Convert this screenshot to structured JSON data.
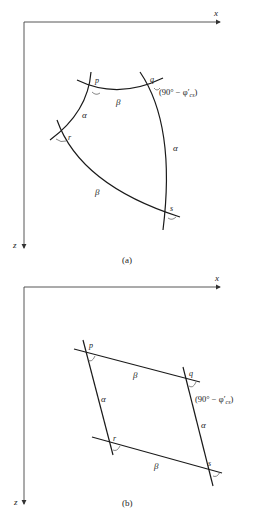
{
  "figure_a": {
    "caption": "(a)",
    "axes": {
      "x_label": "x",
      "z_label": "z"
    },
    "points": {
      "p": "p",
      "q": "q",
      "r": "r",
      "s": "s"
    },
    "edges": {
      "pq": "β",
      "pr": "α",
      "qs": "α",
      "rs": "β"
    },
    "angle_label": "(90° − φ′cs)",
    "angle_main": "(90° − φ′",
    "angle_sub": "cs",
    "angle_close": ")"
  },
  "figure_b": {
    "caption": "(b)",
    "axes": {
      "x_label": "x",
      "z_label": "z"
    },
    "points": {
      "p": "p",
      "q": "q",
      "r": "r",
      "s": "s"
    },
    "edges": {
      "pq": "β",
      "pr": "α",
      "qs": "α",
      "rs": "β"
    },
    "angle_label": "(90° − φ′cs)",
    "angle_main": "(90° − φ′",
    "angle_sub": "cs",
    "angle_close": ")"
  }
}
